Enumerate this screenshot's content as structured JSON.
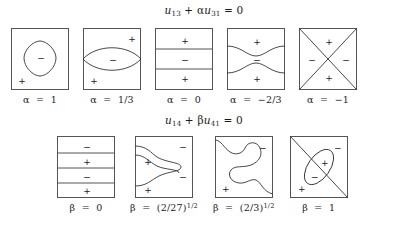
{
  "figure": {
    "rows": [
      {
        "id": "alpha-row",
        "equation": {
          "lhs_var": "u",
          "lhs_sub": "13",
          "operator": "+",
          "coefficient": "α",
          "rhs_var": "u",
          "rhs_sub": "31",
          "equals": "= 0",
          "full_text": "u13 + αu31 = 0"
        },
        "panels": [
          {
            "id": "alpha-1",
            "pattern": "closed-oval",
            "caption": "α = 1",
            "caption_symbol": "α",
            "caption_value": "1",
            "signs": [
              {
                "text": "−",
                "x": 29,
                "y": 29
              },
              {
                "text": "+",
                "x": 10,
                "y": 52
              }
            ]
          },
          {
            "id": "alpha-2",
            "pattern": "lens",
            "caption": "α = 1/3",
            "caption_symbol": "α",
            "caption_value": "1/3",
            "signs": [
              {
                "text": "−",
                "x": 29,
                "y": 31
              },
              {
                "text": "+",
                "x": 48,
                "y": 10
              },
              {
                "text": "+",
                "x": 10,
                "y": 52
              }
            ]
          },
          {
            "id": "alpha-3",
            "pattern": "three-bands",
            "caption": "α = 0",
            "caption_symbol": "α",
            "caption_value": "0",
            "signs": [
              {
                "text": "+",
                "x": 29,
                "y": 12
              },
              {
                "text": "−",
                "x": 29,
                "y": 31
              },
              {
                "text": "+",
                "x": 29,
                "y": 50
              }
            ]
          },
          {
            "id": "alpha-4",
            "pattern": "pinch",
            "caption": "α = −2/3",
            "caption_symbol": "α",
            "caption_value": "−2/3",
            "signs": [
              {
                "text": "+",
                "x": 29,
                "y": 13
              },
              {
                "text": "−",
                "x": 29,
                "y": 31
              },
              {
                "text": "+",
                "x": 29,
                "y": 50
              }
            ]
          },
          {
            "id": "alpha-5",
            "pattern": "cross-diagonals",
            "caption": "α = −1",
            "caption_symbol": "α",
            "caption_value": "−1",
            "signs": [
              {
                "text": "+",
                "x": 29,
                "y": 13
              },
              {
                "text": "−",
                "x": 12,
                "y": 31
              },
              {
                "text": "−",
                "x": 46,
                "y": 31
              },
              {
                "text": "+",
                "x": 29,
                "y": 49
              }
            ]
          }
        ]
      },
      {
        "id": "beta-row",
        "equation": {
          "lhs_var": "u",
          "lhs_sub": "14",
          "operator": "+",
          "coefficient": "β",
          "rhs_var": "u",
          "rhs_sub": "41",
          "equals": "= 0",
          "full_text": "u14 + βu41 = 0"
        },
        "panels": [
          {
            "id": "beta-1",
            "pattern": "four-bands",
            "caption": "β = 0",
            "caption_symbol": "β",
            "caption_value": "0",
            "signs": [
              {
                "text": "−",
                "x": 29,
                "y": 10
              },
              {
                "text": "+",
                "x": 29,
                "y": 25
              },
              {
                "text": "−",
                "x": 29,
                "y": 40
              },
              {
                "text": "+",
                "x": 29,
                "y": 54
              }
            ]
          },
          {
            "id": "beta-2",
            "pattern": "double-tongue",
            "caption": "β = (2/27)^(1/2)",
            "caption_symbol": "β",
            "caption_value": "(2/27)",
            "caption_exponent": "1/2",
            "signs": [
              {
                "text": "−",
                "x": 47,
                "y": 10
              },
              {
                "text": "+",
                "x": 12,
                "y": 25
              },
              {
                "text": "−",
                "x": 47,
                "y": 40
              },
              {
                "text": "+",
                "x": 12,
                "y": 53
              }
            ]
          },
          {
            "id": "beta-3",
            "pattern": "s-wave",
            "caption": "β = (2/3)^(1/2)",
            "caption_symbol": "β",
            "caption_value": "(2/3)",
            "caption_exponent": "1/2",
            "signs": [
              {
                "text": "−",
                "x": 47,
                "y": 11
              },
              {
                "text": "+",
                "x": 10,
                "y": 52
              }
            ]
          },
          {
            "id": "beta-4",
            "pattern": "ellipse-diagonal",
            "caption": "β = 1",
            "caption_symbol": "β",
            "caption_value": "1",
            "signs": [
              {
                "text": "−",
                "x": 47,
                "y": 11
              },
              {
                "text": "+",
                "x": 34,
                "y": 26
              },
              {
                "text": "−",
                "x": 24,
                "y": 40
              },
              {
                "text": "+",
                "x": 11,
                "y": 52
              }
            ]
          }
        ]
      }
    ]
  },
  "style": {
    "box_border_color": "#555555",
    "curve_color": "#333333",
    "background": "#ffffff",
    "text_color": "#1a1a1a"
  }
}
